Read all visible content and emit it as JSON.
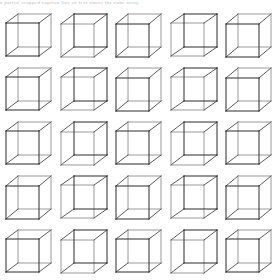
{
  "figure": {
    "name": "necker-cube-array",
    "background_color": "#ffffff",
    "top_artifact_text": "a partial cropped caption line of text above the cube array",
    "grid": {
      "rows": 5,
      "columns": 5,
      "total_cubes": 25,
      "cell_width": 55,
      "cell_height": 54,
      "origin_x": 2,
      "origin_y": 10,
      "cube_size": 33,
      "bottom_row_clipped": true
    },
    "stroke": {
      "front_color": "#2b2b2b",
      "back_color": "#9a9a9a",
      "mid_color": "#5f5f5f",
      "width": 1.0
    }
  },
  "cubes": [
    {
      "id": "r1c1",
      "row": 1,
      "col": 1,
      "dx": 12,
      "dy": -9,
      "front_dark": true
    },
    {
      "id": "r1c2",
      "row": 1,
      "col": 2,
      "dx": 13,
      "dy": -10,
      "front_dark": false
    },
    {
      "id": "r1c3",
      "row": 1,
      "col": 3,
      "dx": 12,
      "dy": -10,
      "front_dark": true
    },
    {
      "id": "r1c4",
      "row": 1,
      "col": 4,
      "dx": 13,
      "dy": -9,
      "front_dark": false
    },
    {
      "id": "r1c5",
      "row": 1,
      "col": 5,
      "dx": 12,
      "dy": -10,
      "front_dark": true
    },
    {
      "id": "r2c1",
      "row": 2,
      "col": 1,
      "dx": 12,
      "dy": -9,
      "front_dark": true
    },
    {
      "id": "r2c2",
      "row": 2,
      "col": 2,
      "dx": 13,
      "dy": -9,
      "front_dark": false
    },
    {
      "id": "r2c3",
      "row": 2,
      "col": 3,
      "dx": 12,
      "dy": -10,
      "front_dark": true
    },
    {
      "id": "r2c4",
      "row": 2,
      "col": 4,
      "dx": 13,
      "dy": -9,
      "front_dark": false
    },
    {
      "id": "r2c5",
      "row": 2,
      "col": 5,
      "dx": 12,
      "dy": -10,
      "front_dark": true
    },
    {
      "id": "r3c1",
      "row": 3,
      "col": 1,
      "dx": 12,
      "dy": -9,
      "front_dark": true
    },
    {
      "id": "r3c2",
      "row": 3,
      "col": 2,
      "dx": 13,
      "dy": -10,
      "front_dark": false
    },
    {
      "id": "r3c3",
      "row": 3,
      "col": 3,
      "dx": 12,
      "dy": -9,
      "front_dark": true
    },
    {
      "id": "r3c4",
      "row": 3,
      "col": 4,
      "dx": 13,
      "dy": -10,
      "front_dark": false
    },
    {
      "id": "r3c5",
      "row": 3,
      "col": 5,
      "dx": 12,
      "dy": -9,
      "front_dark": true
    },
    {
      "id": "r4c1",
      "row": 4,
      "col": 1,
      "dx": 12,
      "dy": -10,
      "front_dark": true
    },
    {
      "id": "r4c2",
      "row": 4,
      "col": 2,
      "dx": 13,
      "dy": -9,
      "front_dark": false
    },
    {
      "id": "r4c3",
      "row": 4,
      "col": 3,
      "dx": 12,
      "dy": -10,
      "front_dark": true
    },
    {
      "id": "r4c4",
      "row": 4,
      "col": 4,
      "dx": 13,
      "dy": -9,
      "front_dark": false
    },
    {
      "id": "r4c5",
      "row": 4,
      "col": 5,
      "dx": 12,
      "dy": -10,
      "front_dark": true
    },
    {
      "id": "r5c1",
      "row": 5,
      "col": 1,
      "dx": 12,
      "dy": -9,
      "front_dark": true
    },
    {
      "id": "r5c2",
      "row": 5,
      "col": 2,
      "dx": 13,
      "dy": -10,
      "front_dark": false
    },
    {
      "id": "r5c3",
      "row": 5,
      "col": 3,
      "dx": 12,
      "dy": -9,
      "front_dark": true
    },
    {
      "id": "r5c4",
      "row": 5,
      "col": 4,
      "dx": 13,
      "dy": -10,
      "front_dark": false
    },
    {
      "id": "r5c5",
      "row": 5,
      "col": 5,
      "dx": 12,
      "dy": -9,
      "front_dark": true
    }
  ]
}
